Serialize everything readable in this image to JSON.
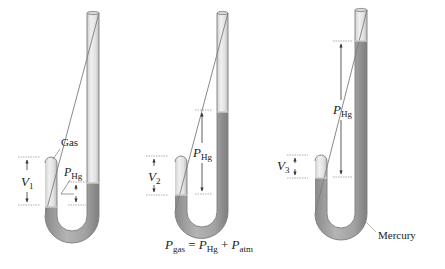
{
  "figure": {
    "colors": {
      "glass": "#e4e4e4",
      "glass_edge": "#8a8a8a",
      "mercury": "#9c9c9c",
      "mercury_light": "#b8b8b8",
      "dim_line": "#444444",
      "text": "#222222"
    },
    "manometers": [
      {
        "id": "1",
        "gas_label": "Gas",
        "volume_label": "V",
        "volume_sub": "1",
        "pressure_label": "P",
        "pressure_sub": "Hg"
      },
      {
        "id": "2",
        "volume_label": "V",
        "volume_sub": "2",
        "pressure_label": "P",
        "pressure_sub": "Hg",
        "equation": {
          "lhs": "P",
          "lhs_sub": "gas",
          "eq": " = ",
          "t1": "P",
          "t1_sub": "Hg",
          "plus": " + ",
          "t2": "P",
          "t2_sub": "atm"
        }
      },
      {
        "id": "3",
        "volume_label": "V",
        "volume_sub": "3",
        "pressure_label": "P",
        "pressure_sub": "Hg",
        "mercury_label": "Mercury"
      }
    ]
  }
}
